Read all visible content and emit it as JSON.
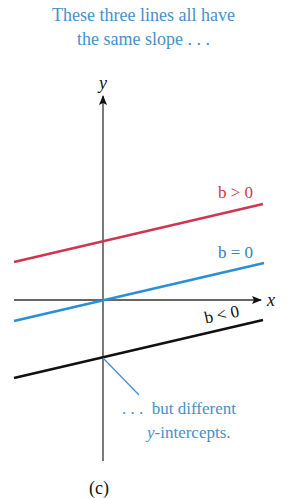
{
  "caption": {
    "line1": "These three lines all have",
    "line2": "the same slope . . ."
  },
  "axes": {
    "x_label": "x",
    "y_label": "y"
  },
  "lines": [
    {
      "label": "b > 0",
      "color": "#d0364f"
    },
    {
      "label": "b = 0",
      "color": "#2a8fd4"
    },
    {
      "label": "b < 0",
      "color": "#111111"
    }
  ],
  "annotation": {
    "line1": ". . .  but different",
    "line2_italic": "y",
    "line2_rest": "-intercepts.",
    "color": "#4a90c8"
  },
  "figure_label": "(c)"
}
